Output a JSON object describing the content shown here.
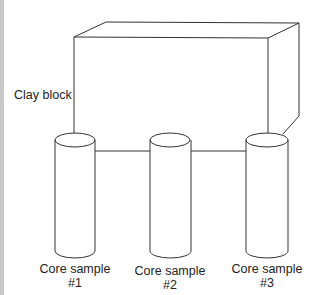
{
  "diagram": {
    "block_label": "Clay block",
    "samples": [
      {
        "name": "Core sample",
        "number": "#1"
      },
      {
        "name": "Core sample",
        "number": "#2"
      },
      {
        "name": "Core sample",
        "number": "#3"
      }
    ],
    "colors": {
      "line": "#333333",
      "edge_bar": "#c8c8c8",
      "background": "#ffffff"
    }
  }
}
